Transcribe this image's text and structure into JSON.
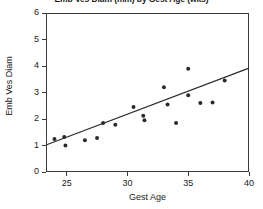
{
  "chart_data": {
    "type": "scatter",
    "title": "Emb Ves Diam (mm) by Gest Age (wks)",
    "xlabel": "Gest Age",
    "ylabel": "Emb Ves Diam",
    "xlim": [
      23.3,
      40
    ],
    "ylim": [
      0,
      6
    ],
    "xticks": [
      25,
      30,
      35,
      40
    ],
    "yticks": [
      0,
      1,
      2,
      3,
      4,
      5,
      6
    ],
    "grid": false,
    "legend": false,
    "marker_color": "#2b2b2b",
    "line_color": "#2b2b2b",
    "frame_color": "#3a3a3a",
    "points": [
      {
        "x": 24.0,
        "y": 1.25
      },
      {
        "x": 24.8,
        "y": 1.32
      },
      {
        "x": 24.9,
        "y": 1.0
      },
      {
        "x": 26.5,
        "y": 1.2
      },
      {
        "x": 27.5,
        "y": 1.28
      },
      {
        "x": 28.0,
        "y": 1.85
      },
      {
        "x": 29.0,
        "y": 1.78
      },
      {
        "x": 30.5,
        "y": 2.45
      },
      {
        "x": 31.3,
        "y": 2.12
      },
      {
        "x": 31.4,
        "y": 1.95
      },
      {
        "x": 33.0,
        "y": 3.2
      },
      {
        "x": 33.3,
        "y": 2.55
      },
      {
        "x": 34.0,
        "y": 1.85
      },
      {
        "x": 35.0,
        "y": 3.9
      },
      {
        "x": 35.0,
        "y": 2.9
      },
      {
        "x": 36.0,
        "y": 2.6
      },
      {
        "x": 37.0,
        "y": 2.62
      },
      {
        "x": 38.0,
        "y": 3.45
      }
    ],
    "fit_line": {
      "name": "linear fit",
      "x_start": 23.3,
      "y_start": 1.02,
      "x_end": 40.0,
      "y_end": 3.92
    }
  }
}
